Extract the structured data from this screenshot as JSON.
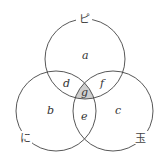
{
  "diagram": {
    "type": "venn-3",
    "sets": [
      {
        "id": "top",
        "label": "ピ"
      },
      {
        "id": "left",
        "label": "に"
      },
      {
        "id": "right",
        "label": "玉"
      }
    ],
    "regions": {
      "a": "a",
      "b": "b",
      "c": "c",
      "d": "d",
      "e": "e",
      "f": "f",
      "g": "g"
    },
    "shaded_region": "g",
    "colors": {
      "stroke": "#444444",
      "shade": "#cccccc"
    }
  }
}
